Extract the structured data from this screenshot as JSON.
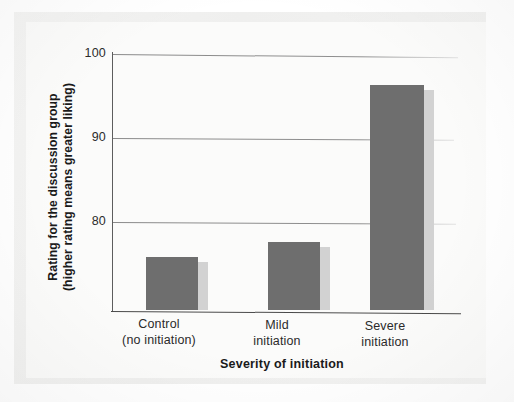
{
  "chart_data": {
    "type": "bar",
    "title": "",
    "xlabel": "Severity of initiation",
    "ylabel": "Rating for the discussion group (higher rating means greater liking)",
    "ylabel_line1": "Rating for the discussion group",
    "ylabel_line2": "(higher rating means greater liking)",
    "categories": [
      "Control (no initiation)",
      "Mild initiation",
      "Severe initiation"
    ],
    "category_lines": [
      {
        "line1": "Control",
        "line2": "(no initiation)"
      },
      {
        "line1": "Mild",
        "line2": "initiation"
      },
      {
        "line1": "Severe",
        "line2": "initiation"
      }
    ],
    "values": [
      79.8,
      81.3,
      96.9
    ],
    "ylim": [
      74.5,
      100
    ],
    "yticks": [
      80,
      90,
      100
    ],
    "ytick_labels": [
      "80",
      "90",
      "100"
    ],
    "grid": true,
    "legend": "none",
    "bar_color": "#6e6e6e",
    "bar_shadow_color": "#d2d2d2",
    "axis_color": "#4a4a4a",
    "gridline_color": "#8a8a8a",
    "background_color": "#fbfbfa",
    "page_color": "#f2f2f1"
  }
}
